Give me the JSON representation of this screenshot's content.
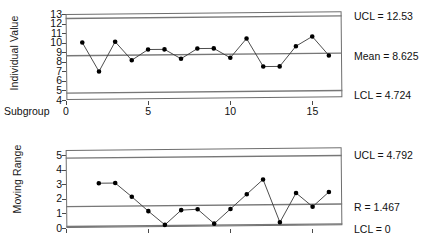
{
  "chart_data": [
    {
      "type": "line",
      "title": "",
      "name": "individuals-chart",
      "ylabel": "Individual Value",
      "xlabel": "Subgroup",
      "x": [
        1,
        2,
        3,
        4,
        5,
        6,
        7,
        8,
        9,
        10,
        11,
        12,
        13,
        14,
        15,
        16
      ],
      "values": [
        10.0,
        6.95,
        10.05,
        8.1,
        9.2,
        9.2,
        8.2,
        9.25,
        9.25,
        8.25,
        10.25,
        7.3,
        7.3,
        9.4,
        10.4,
        8.4
      ],
      "ylim": [
        4,
        13
      ],
      "yticks": [
        4,
        5,
        6,
        7,
        8,
        9,
        10,
        11,
        12,
        13
      ],
      "xlim": [
        0,
        16.8
      ],
      "xticks": [
        0,
        5,
        10,
        15
      ],
      "grid": false,
      "limits": {
        "ucl": 12.53,
        "center": 8.625,
        "lcl": 4.724
      },
      "annotations": [
        {
          "name": "ucl-label",
          "text": "UCL = 12.53",
          "value": 12.53
        },
        {
          "name": "mean-label",
          "text": "Mean = 8.625",
          "value": 8.625
        },
        {
          "name": "lcl-label",
          "text": "LCL = 4.724",
          "value": 4.724
        }
      ]
    },
    {
      "type": "line",
      "title": "",
      "name": "moving-range-chart",
      "ylabel": "Moving Range",
      "xlabel": "",
      "x": [
        2,
        3,
        4,
        5,
        6,
        7,
        8,
        9,
        10,
        11,
        12,
        13,
        14,
        15,
        16
      ],
      "values": [
        3.05,
        3.05,
        2.1,
        1.1,
        0.15,
        1.15,
        1.2,
        0.2,
        1.2,
        2.2,
        3.2,
        0.25,
        2.25,
        1.3,
        2.3
      ],
      "ylim": [
        0,
        5.35
      ],
      "yticks": [
        0,
        1,
        2,
        3,
        4,
        5
      ],
      "xlim": [
        0,
        16.8
      ],
      "xticks": [
        0,
        5,
        10,
        15
      ],
      "grid": false,
      "limits": {
        "ucl": 4.792,
        "center": 1.467,
        "lcl": 0
      },
      "annotations": [
        {
          "name": "ucl-label",
          "text": "UCL = 4.792",
          "value": 4.792
        },
        {
          "name": "r-label",
          "text": "R = 1.467",
          "value": 1.467
        },
        {
          "name": "lcl-label",
          "text": "LCL = 0",
          "value": 0
        }
      ]
    }
  ],
  "individuals": {
    "ylabel": "Individual Value",
    "xlabel": "Subgroup",
    "yticks": [
      "13",
      "12",
      "11",
      "10",
      "9",
      "8",
      "7",
      "6",
      "5",
      "4"
    ],
    "xticks": [
      "0",
      "5",
      "10",
      "15"
    ],
    "ucl_label": "UCL = 12.53",
    "mean_label": "Mean = 8.625",
    "lcl_label": "LCL = 4.724"
  },
  "movingrange": {
    "ylabel": "Moving Range",
    "yticks": [
      "5",
      "4",
      "3",
      "2",
      "1",
      "0"
    ],
    "ucl_label": "UCL = 4.792",
    "r_label": "R = 1.467",
    "lcl_label": "LCL = 0"
  },
  "colors": {
    "line": "#3a3a3a",
    "marker": "#000000",
    "limit_line": "#777777",
    "frame": "#6e6e6e",
    "text": "#111111"
  }
}
